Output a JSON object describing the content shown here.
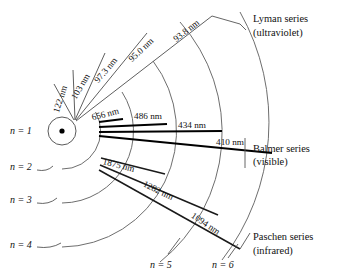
{
  "figure": {
    "nucleus_label": "nucleus",
    "colors": {
      "arc": "#6e6e6e",
      "lyman": "#5f5f5f",
      "balmer": "#000000",
      "paschen": "#1a1a1a",
      "background": "#ffffff",
      "text": "#111111"
    }
  },
  "levels": [
    {
      "id": "n1",
      "label": "n = 1",
      "n": 1,
      "label_x": 10,
      "label_y": 134,
      "radius": 14
    },
    {
      "id": "n2",
      "label": "n = 2",
      "n": 2,
      "label_x": 10,
      "label_y": 170,
      "radius": 38
    },
    {
      "id": "n3",
      "label": "n = 3",
      "n": 3,
      "label_x": 10,
      "label_y": 203,
      "radius": 72
    },
    {
      "id": "n4",
      "label": "n = 4",
      "n": 4,
      "label_x": 10,
      "label_y": 248,
      "radius": 116
    },
    {
      "id": "n5",
      "label": "n = 5",
      "n": 5,
      "label_x": 150,
      "label_y": 268,
      "radius": 166
    },
    {
      "id": "n6",
      "label": "n = 6",
      "n": 6,
      "label_x": 212,
      "label_y": 268,
      "radius": 225
    }
  ],
  "series": [
    {
      "id": "lyman",
      "name": "Lyman series",
      "range": "(ultraviolet)",
      "name_x": 253,
      "name_y": 22,
      "range_x": 253,
      "range_y": 36,
      "final_level": 1,
      "transitions": [
        {
          "from": 2,
          "to": 1,
          "wavelength": "122 nm",
          "value_nm": 122,
          "label_x": 63,
          "label_y": 100,
          "rotate": -72
        },
        {
          "from": 3,
          "to": 1,
          "wavelength": "103 nm",
          "value_nm": 103,
          "label_x": 83,
          "label_y": 88,
          "rotate": -60
        },
        {
          "from": 4,
          "to": 1,
          "wavelength": "97.3 nm",
          "value_nm": 97.3,
          "label_x": 108,
          "label_y": 72,
          "rotate": -50
        },
        {
          "from": 5,
          "to": 1,
          "wavelength": "95.0 nm",
          "value_nm": 95.0,
          "label_x": 143,
          "label_y": 52,
          "rotate": -43
        },
        {
          "from": 6,
          "to": 1,
          "wavelength": "93.8 nm",
          "value_nm": 93.8,
          "label_x": 188,
          "label_y": 33,
          "rotate": -38
        }
      ]
    },
    {
      "id": "balmer",
      "name": "Balmer series",
      "range": "(visible)",
      "name_x": 253,
      "name_y": 152,
      "range_x": 253,
      "range_y": 165,
      "final_level": 2,
      "transitions": [
        {
          "from": 3,
          "to": 2,
          "wavelength": "656 nm",
          "value_nm": 656,
          "label_x": 106,
          "label_y": 117,
          "rotate": -14
        },
        {
          "from": 4,
          "to": 2,
          "wavelength": "486 nm",
          "value_nm": 486,
          "label_x": 148,
          "label_y": 119,
          "rotate": 0
        },
        {
          "from": 5,
          "to": 2,
          "wavelength": "434 nm",
          "value_nm": 434,
          "label_x": 192,
          "label_y": 128,
          "rotate": 0
        },
        {
          "from": 6,
          "to": 2,
          "wavelength": "410 nm",
          "value_nm": 410,
          "label_x": 230,
          "label_y": 145,
          "rotate": 0
        }
      ]
    },
    {
      "id": "paschen",
      "name": "Paschen series",
      "range": "(infrared)",
      "name_x": 253,
      "name_y": 240,
      "range_x": 253,
      "range_y": 254,
      "final_level": 3,
      "transitions": [
        {
          "from": 4,
          "to": 3,
          "wavelength": "1875 nm",
          "value_nm": 1875,
          "label_x": 118,
          "label_y": 168,
          "rotate": 14
        },
        {
          "from": 5,
          "to": 3,
          "wavelength": "1282 nm",
          "value_nm": 1282,
          "label_x": 157,
          "label_y": 193,
          "rotate": 26
        },
        {
          "from": 6,
          "to": 3,
          "wavelength": "1094 nm",
          "value_nm": 1094,
          "label_x": 204,
          "label_y": 226,
          "rotate": 34
        }
      ]
    }
  ]
}
